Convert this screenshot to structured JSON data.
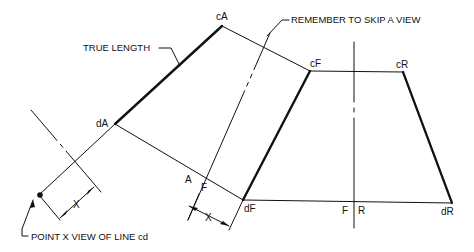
{
  "diagram": {
    "type": "descriptive-geometry-auxiliary-views",
    "notes": {
      "true_length": "TRUE LENGTH",
      "skip_view": "REMEMBER TO SKIP A VIEW",
      "point_view": "POINT X VIEW OF LINE cd"
    },
    "points": {
      "cA": "cA",
      "dA": "dA",
      "cF": "cF",
      "dF": "dF",
      "cR": "cR",
      "dR": "dR"
    },
    "fold_labels": {
      "A": "A",
      "F1": "F",
      "F2": "F",
      "R": "R"
    },
    "dimension_label_1": "X",
    "dimension_label_2": "X",
    "colors": {
      "line": "#111111",
      "background": "#ffffff"
    }
  }
}
